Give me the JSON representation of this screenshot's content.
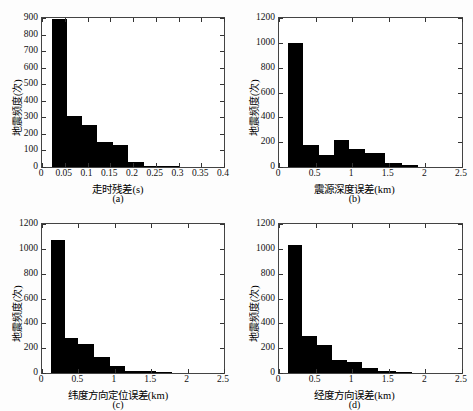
{
  "figure": {
    "background": "#fdfdfd",
    "bar_color": "#000000",
    "axis_color": "#444444"
  },
  "chart_data": [
    {
      "type": "bar",
      "panel": "a",
      "caption": "(a)",
      "title": "",
      "xlabel": "走时残差(s)",
      "ylabel": "地震频度(次)",
      "xlim": [
        0,
        0.4
      ],
      "ylim": [
        0,
        900
      ],
      "xticks": [
        0,
        0.05,
        0.1,
        0.15,
        0.2,
        0.25,
        0.3,
        0.35,
        0.4
      ],
      "xticklabels": [
        "0",
        "0.05",
        "0.1",
        "0.15",
        "0.2",
        "0.25",
        "0.3",
        "0.35",
        "0.4"
      ],
      "yticks": [
        0,
        100,
        200,
        300,
        400,
        500,
        600,
        700,
        800,
        900
      ],
      "yticklabels": [
        "0",
        "100",
        "200",
        "300",
        "400",
        "500",
        "600",
        "700",
        "800",
        "900"
      ],
      "grid": false,
      "legend": "none",
      "bin_edges": [
        0.022,
        0.055,
        0.088,
        0.12,
        0.155,
        0.19,
        0.225,
        0.3
      ],
      "values": [
        895,
        308,
        253,
        150,
        133,
        30,
        5
      ]
    },
    {
      "type": "bar",
      "panel": "b",
      "caption": "(b)",
      "title": "",
      "xlabel": "震源深度误差(km)",
      "ylabel": "地震频度(次)",
      "xlim": [
        0,
        2.5
      ],
      "ylim": [
        0,
        1200
      ],
      "xticks": [
        0,
        0.5,
        1,
        1.5,
        2,
        2.5
      ],
      "xticklabels": [
        "0",
        "0.5",
        "1",
        "1.5",
        "2",
        "2.5"
      ],
      "yticks": [
        0,
        200,
        400,
        600,
        800,
        1000,
        1200
      ],
      "yticklabels": [
        "0",
        "200",
        "400",
        "600",
        "800",
        "1000",
        "1200"
      ],
      "grid": false,
      "legend": "none",
      "bin_edges": [
        0.12,
        0.33,
        0.54,
        0.75,
        0.96,
        1.17,
        1.45,
        1.68,
        1.9
      ],
      "values": [
        1000,
        180,
        95,
        215,
        142,
        110,
        30,
        18
      ]
    },
    {
      "type": "bar",
      "panel": "c",
      "caption": "(c)",
      "title": "",
      "xlabel": "纬度方向定位误差(km)",
      "ylabel": "地震频度(次)",
      "xlim": [
        0,
        2.5
      ],
      "ylim": [
        0,
        1200
      ],
      "xticks": [
        0,
        0.5,
        1,
        1.5,
        2,
        2.5
      ],
      "xticklabels": [
        "0",
        "0.5",
        "1",
        "1.5",
        "2",
        "2.5"
      ],
      "yticks": [
        0,
        200,
        400,
        600,
        800,
        1000,
        1200
      ],
      "yticklabels": [
        "0",
        "200",
        "400",
        "600",
        "800",
        "1000",
        "1200"
      ],
      "grid": false,
      "legend": "none",
      "bin_edges": [
        0.12,
        0.31,
        0.5,
        0.72,
        0.93,
        1.14,
        1.35,
        1.56,
        1.78
      ],
      "values": [
        1070,
        283,
        233,
        130,
        53,
        18,
        14,
        5
      ]
    },
    {
      "type": "bar",
      "panel": "d",
      "caption": "(d)",
      "title": "",
      "xlabel": "经度方向误差(km)",
      "ylabel": "地震频度(次)",
      "xlim": [
        0,
        2.5
      ],
      "ylim": [
        0,
        1200
      ],
      "xticks": [
        0,
        0.5,
        1,
        1.5,
        2,
        2.5
      ],
      "xticklabels": [
        "0",
        "0.5",
        "1",
        "1.5",
        "2",
        "2.5"
      ],
      "yticks": [
        0,
        200,
        400,
        600,
        800,
        1000,
        1200
      ],
      "yticklabels": [
        "0",
        "200",
        "400",
        "600",
        "800",
        "1000",
        "1200"
      ],
      "grid": false,
      "legend": "none",
      "bin_edges": [
        0.12,
        0.31,
        0.52,
        0.72,
        0.93,
        1.14,
        1.35,
        1.6,
        1.82
      ],
      "values": [
        1028,
        295,
        228,
        103,
        92,
        44,
        14,
        10
      ]
    }
  ]
}
